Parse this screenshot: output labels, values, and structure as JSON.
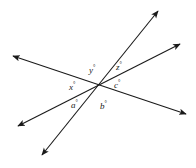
{
  "figure": {
    "background_color": "#ffffff",
    "stroke_color": "#1a1a1a",
    "stroke_width": 1.1,
    "intersection": {
      "x": 100,
      "y": 88
    },
    "lines": [
      {
        "name": "line-upper-left-to-lower-right",
        "from": {
          "x": 13,
          "y": 56
        },
        "to": {
          "x": 186,
          "y": 114
        },
        "arrow_start": true,
        "arrow_end": true
      },
      {
        "name": "line-lower-left-to-upper-right",
        "from": {
          "x": 18,
          "y": 126
        },
        "to": {
          "x": 180,
          "y": 44
        },
        "arrow_start": true,
        "arrow_end": true
      },
      {
        "name": "line-lower-left-steep-to-upper-right-steep",
        "from": {
          "x": 42,
          "y": 155
        },
        "to": {
          "x": 158,
          "y": 11
        },
        "arrow_start": true,
        "arrow_end": true
      }
    ],
    "labels": [
      {
        "name": "angle-label-y",
        "variable": "y",
        "degree_symbol": "°",
        "x": 89,
        "y": 64
      },
      {
        "name": "angle-label-z",
        "variable": "z",
        "degree_symbol": "°",
        "x": 116,
        "y": 61
      },
      {
        "name": "angle-label-c",
        "variable": "c",
        "degree_symbol": "°",
        "x": 114,
        "y": 79
      },
      {
        "name": "angle-label-x",
        "variable": "x",
        "degree_symbol": "°",
        "x": 69,
        "y": 81
      },
      {
        "name": "angle-label-a",
        "variable": "a",
        "degree_symbol": "°",
        "x": 71,
        "y": 99
      },
      {
        "name": "angle-label-b",
        "variable": "b",
        "degree_symbol": "°",
        "x": 100,
        "y": 100
      }
    ]
  }
}
